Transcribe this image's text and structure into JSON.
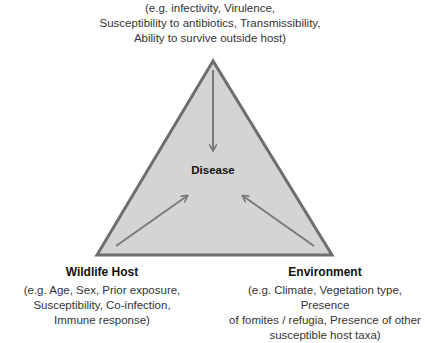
{
  "pathogen": {
    "description_lines": [
      "(e.g. infectivity, Virulence,",
      "Susceptibility to antibiotics, Transmissibility,",
      "Ability to survive outside host)"
    ]
  },
  "center": {
    "label": "Disease"
  },
  "host": {
    "title": "Wildlife Host",
    "description_lines": [
      "(e.g. Age, Sex, Prior exposure,",
      "Susceptibility, Co-infection,",
      "Immune response)"
    ]
  },
  "environment": {
    "title": "Environment",
    "description_lines": [
      "(e.g. Climate, Vegetation type, Presence",
      "of fomites / refugia, Presence of other",
      "susceptible host taxa)"
    ]
  },
  "colors": {
    "triangle_fill": "#d4d4d4",
    "triangle_stroke": "#6e6e6e",
    "arrow": "#7a7a7a"
  }
}
